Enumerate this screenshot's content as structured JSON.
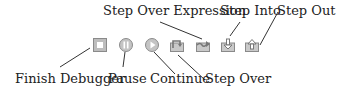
{
  "labels": {
    "finish_debugger": "Finish Debugger",
    "pause": "Pause",
    "continue": "Continue",
    "step_over": "Step Over",
    "step_over_expression": "Step Over Expression",
    "step_into": "Step Into",
    "step_out": "Step Out"
  },
  "icons": [
    "stop-icon",
    "pause-icon",
    "play-icon",
    "step-over-icon",
    "step-over-expression-icon",
    "step-into-icon",
    "step-out-icon"
  ],
  "colors": {
    "icon_fill": "#c9c9c9",
    "icon_border": "#8a8a8a",
    "line": "#333333",
    "text": "#222222"
  }
}
